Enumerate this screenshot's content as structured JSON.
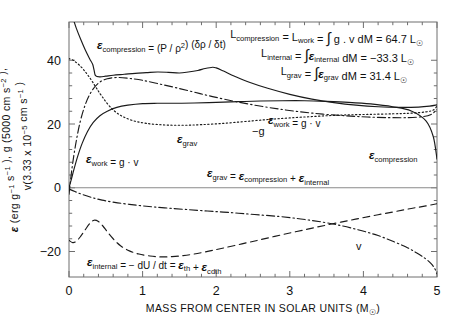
{
  "figure": {
    "background": "#ffffff",
    "ink_color": "#1a1a1a",
    "axis_color": "#6e6e6e"
  },
  "axes": {
    "x": {
      "label_prefix": "MASS FROM CENTER IN SOLAR UNITS (M",
      "label_suffix": ")",
      "label_sub": "☉",
      "ticks": [
        "0",
        "1",
        "2",
        "3",
        "4",
        "5"
      ],
      "tick_values": [
        0,
        1,
        2,
        3,
        4,
        5
      ],
      "range": [
        0,
        5
      ],
      "minor_per_interval": 4
    },
    "y": {
      "label_parts": {
        "eps": "ε",
        "p1": " (erg g",
        "e1": "−1",
        "p2": " s",
        "e2": "−1",
        "p3": " ), g (5000 cm s",
        "e3": "−2",
        "p4": " ),",
        "line2_a": "v(3.33 x 10",
        "line2_e": "−5",
        "line2_b": " cm s",
        "line2_e2": "−1",
        "line2_c": " )"
      },
      "ticks": [
        "40",
        "20",
        "0",
        "−20"
      ],
      "tick_values": [
        40,
        20,
        0,
        -20
      ],
      "range": [
        -28,
        52
      ],
      "minor_per_interval": 4
    }
  },
  "annotations": {
    "luminosity_block": [
      {
        "id": "L-compression",
        "segments": [
          {
            "t": "L",
            "style": "plain"
          },
          {
            "t": "compression",
            "style": "sub"
          },
          {
            "t": " = L",
            "style": "plain"
          },
          {
            "t": "work",
            "style": "sub"
          },
          {
            "t": " = ",
            "style": "plain"
          },
          {
            "t": "∫",
            "style": "integral"
          },
          {
            "t": " g . v dM = 64.7 L",
            "style": "plain"
          },
          {
            "t": "☉",
            "style": "sub"
          }
        ]
      },
      {
        "id": "L-internal",
        "segments": [
          {
            "t": "L",
            "style": "plain"
          },
          {
            "t": "internal",
            "style": "sub"
          },
          {
            "t": " = ",
            "style": "plain"
          },
          {
            "t": "∫",
            "style": "integral"
          },
          {
            "t": "ε",
            "style": "eps"
          },
          {
            "t": "internal",
            "style": "sub"
          },
          {
            "t": " dM = −33.3 L",
            "style": "plain"
          },
          {
            "t": "☉",
            "style": "sub"
          }
        ]
      },
      {
        "id": "L-grav",
        "segments": [
          {
            "t": "L",
            "style": "plain"
          },
          {
            "t": "grav",
            "style": "sub"
          },
          {
            "t": " = ",
            "style": "plain"
          },
          {
            "t": "∫",
            "style": "integral"
          },
          {
            "t": "ε",
            "style": "eps"
          },
          {
            "t": "grav",
            "style": "sub"
          },
          {
            "t": " dM = 31.4 L",
            "style": "plain"
          },
          {
            "t": "☉",
            "style": "sub"
          }
        ]
      }
    ],
    "curve_labels": [
      {
        "id": "eps-compression-def",
        "x": 97,
        "y": 49,
        "segments": [
          {
            "t": "ε",
            "style": "eps"
          },
          {
            "t": "compression",
            "style": "sub"
          },
          {
            "t": " = (P / ρ",
            "style": "plain"
          },
          {
            "t": "2",
            "style": "sup"
          },
          {
            "t": ") (δρ / δt)",
            "style": "plain"
          }
        ]
      },
      {
        "id": "eps-work-def",
        "x": 86,
        "y": 163,
        "segments": [
          {
            "t": "ε",
            "style": "eps"
          },
          {
            "t": "work",
            "style": "sub"
          },
          {
            "t": " = g · v",
            "style": "plain"
          }
        ]
      },
      {
        "id": "eps-work-top",
        "x": 268,
        "y": 124,
        "segments": [
          {
            "t": "ε",
            "style": "eps"
          },
          {
            "t": "work",
            "style": "sub"
          },
          {
            "t": " = g · v",
            "style": "plain"
          }
        ]
      },
      {
        "id": "eps-grav-label",
        "x": 177,
        "y": 143,
        "segments": [
          {
            "t": "ε",
            "style": "eps"
          },
          {
            "t": "grav",
            "style": "sub"
          }
        ]
      },
      {
        "id": "minus-g-label",
        "x": 252,
        "y": 135,
        "segments": [
          {
            "t": "−g",
            "style": "plain"
          }
        ]
      },
      {
        "id": "eps-compression-right",
        "x": 369,
        "y": 159,
        "segments": [
          {
            "t": "ε",
            "style": "eps"
          },
          {
            "t": "compression",
            "style": "sub"
          }
        ]
      },
      {
        "id": "eps-grav-sum",
        "x": 207,
        "y": 177,
        "segments": [
          {
            "t": "ε",
            "style": "eps"
          },
          {
            "t": "grav",
            "style": "sub"
          },
          {
            "t": " = ",
            "style": "plain"
          },
          {
            "t": "ε",
            "style": "eps"
          },
          {
            "t": "compression",
            "style": "sub"
          },
          {
            "t": " + ",
            "style": "plain"
          },
          {
            "t": "ε",
            "style": "eps"
          },
          {
            "t": "internal",
            "style": "sub"
          }
        ]
      },
      {
        "id": "eps-internal-def",
        "x": 87,
        "y": 266,
        "segments": [
          {
            "t": "ε",
            "style": "eps"
          },
          {
            "t": "internal",
            "style": "sub"
          },
          {
            "t": " = − dU / dt = ",
            "style": "plain"
          },
          {
            "t": "ε",
            "style": "eps"
          },
          {
            "t": "th",
            "style": "sub"
          },
          {
            "t": " + ",
            "style": "plain"
          },
          {
            "t": "ε",
            "style": "eps"
          },
          {
            "t": "cdth",
            "style": "sub"
          }
        ]
      },
      {
        "id": "v-label",
        "x": 356,
        "y": 250,
        "segments": [
          {
            "t": "v",
            "style": "plain"
          }
        ]
      }
    ]
  },
  "chart_data": {
    "type": "line",
    "title": "",
    "xlabel": "MASS FROM CENTER IN SOLAR UNITS (M_sun)",
    "ylabel": "epsilon (erg g^-1 s^-1), g (5000 cm s^-2), v(3.33 x 10^-5 cm s^-1)",
    "xlim": [
      0,
      5
    ],
    "ylim": [
      -28,
      52
    ],
    "grid": false,
    "legend": "inline curve labels",
    "series": [
      {
        "name": "epsilon_compression",
        "linestyle": "solid",
        "label_on_plot": "ε_compression",
        "x": [
          0.0,
          0.05,
          0.1,
          0.16,
          0.22,
          0.28,
          0.32,
          0.34,
          0.36,
          0.42,
          0.5,
          0.6,
          0.75,
          0.9,
          1.05,
          1.2,
          1.35,
          1.5,
          1.62,
          1.75,
          1.85,
          1.95,
          2.0,
          2.1,
          2.25,
          2.45,
          2.7,
          3.0,
          3.3,
          3.6,
          3.9,
          4.2,
          4.5,
          4.75,
          4.9,
          5.0
        ],
        "y": [
          57.0,
          53.5,
          50.0,
          46.5,
          43.3,
          40.5,
          38.8,
          37.0,
          35.2,
          34.8,
          35.0,
          35.3,
          35.6,
          35.9,
          36.1,
          36.3,
          36.2,
          36.0,
          36.3,
          36.8,
          37.4,
          37.8,
          37.6,
          36.6,
          35.0,
          33.1,
          31.2,
          29.3,
          27.8,
          26.7,
          25.9,
          25.4,
          25.2,
          25.3,
          25.6,
          26.0
        ]
      },
      {
        "name": "epsilon_work",
        "linestyle": "solid",
        "label_on_plot": "ε_work = g · v",
        "x": [
          0.0,
          0.03,
          0.07,
          0.12,
          0.18,
          0.25,
          0.33,
          0.42,
          0.52,
          0.65,
          0.8,
          1.0,
          1.2,
          1.45,
          1.7,
          2.0,
          2.3,
          2.6,
          2.9,
          3.2,
          3.5,
          3.8,
          4.1,
          4.4,
          4.65,
          4.85,
          4.95,
          5.0
        ],
        "y": [
          0.0,
          2.5,
          6.0,
          10.0,
          14.0,
          17.6,
          20.5,
          22.6,
          24.0,
          25.2,
          25.9,
          26.4,
          26.5,
          26.5,
          26.6,
          26.8,
          27.0,
          27.2,
          27.3,
          27.3,
          27.1,
          26.8,
          26.3,
          25.4,
          24.1,
          21.0,
          16.0,
          9.0
        ]
      },
      {
        "name": "epsilon_grav",
        "linestyle": "dotted",
        "label_on_plot": "ε_grav = ε_compression + ε_internal",
        "x": [
          0.0,
          0.04,
          0.08,
          0.14,
          0.2,
          0.26,
          0.32,
          0.38,
          0.45,
          0.55,
          0.68,
          0.85,
          1.05,
          1.3,
          1.55,
          1.8,
          2.1,
          2.4,
          2.7,
          3.0,
          3.35,
          3.7,
          4.05,
          4.4,
          4.65,
          4.85,
          4.95,
          5.0
        ],
        "y": [
          40.5,
          40.2,
          39.6,
          38.5,
          37.0,
          35.2,
          33.2,
          31.0,
          28.6,
          25.6,
          23.0,
          21.2,
          20.2,
          19.7,
          19.6,
          19.8,
          20.2,
          20.8,
          21.4,
          21.9,
          22.4,
          22.8,
          23.0,
          23.2,
          23.4,
          23.8,
          24.4,
          25.6
        ]
      },
      {
        "name": "minus_g",
        "linestyle": "dashdot",
        "label_on_plot": "−g",
        "x": [
          0.0,
          0.04,
          0.09,
          0.15,
          0.22,
          0.3,
          0.4,
          0.52,
          0.66,
          0.82,
          1.0,
          1.22,
          1.45,
          1.7,
          1.95,
          2.25,
          2.55,
          2.85,
          3.15,
          3.45,
          3.75,
          4.05,
          4.35,
          4.6,
          4.8,
          4.92,
          5.0
        ],
        "y": [
          -2.0,
          6.0,
          13.5,
          20.5,
          26.0,
          30.0,
          32.8,
          34.2,
          34.6,
          34.3,
          33.7,
          32.6,
          31.4,
          30.0,
          28.6,
          27.1,
          25.8,
          24.7,
          23.8,
          23.1,
          22.6,
          22.2,
          22.0,
          22.0,
          22.3,
          23.0,
          24.5
        ]
      },
      {
        "name": "epsilon_internal",
        "linestyle": "dashed",
        "label_on_plot": "ε_internal = − dU/dt",
        "x": [
          0.0,
          0.05,
          0.1,
          0.16,
          0.22,
          0.28,
          0.34,
          0.4,
          0.46,
          0.52,
          0.6,
          0.7,
          0.82,
          0.95,
          1.1,
          1.25,
          1.4,
          1.55,
          1.7,
          1.9,
          2.1,
          2.35,
          2.6,
          2.9,
          3.2,
          3.5,
          3.8,
          4.1,
          4.4,
          4.65,
          4.85,
          5.0
        ],
        "y": [
          -16.5,
          -17.2,
          -16.8,
          -15.2,
          -13.2,
          -11.3,
          -10.2,
          -10.6,
          -12.0,
          -13.8,
          -16.0,
          -18.2,
          -19.8,
          -20.8,
          -21.4,
          -21.7,
          -21.6,
          -21.3,
          -20.8,
          -19.9,
          -18.9,
          -17.6,
          -16.3,
          -14.7,
          -13.2,
          -11.7,
          -10.3,
          -8.9,
          -7.6,
          -6.5,
          -5.7,
          -5.0
        ]
      },
      {
        "name": "velocity_v",
        "linestyle": "dashdot",
        "label_on_plot": "v",
        "x": [
          0.0,
          0.08,
          0.18,
          0.3,
          0.45,
          0.62,
          0.82,
          1.05,
          1.3,
          1.58,
          1.88,
          2.2,
          2.52,
          2.85,
          3.15,
          3.45,
          3.72,
          3.98,
          4.2,
          4.4,
          4.58,
          4.72,
          4.84,
          4.92,
          4.97,
          5.0
        ],
        "y": [
          -0.4,
          -1.2,
          -2.1,
          -3.0,
          -3.9,
          -4.6,
          -5.2,
          -5.8,
          -6.3,
          -6.8,
          -7.3,
          -7.8,
          -8.4,
          -9.0,
          -9.8,
          -10.8,
          -12.0,
          -13.5,
          -15.0,
          -16.8,
          -18.6,
          -20.4,
          -22.2,
          -23.8,
          -25.4,
          -27.0
        ]
      }
    ],
    "secondary_epsilon_work_upper": {
      "name": "epsilon_work_upper_branch",
      "note": "upper solid arc peaking near 28 used as the g.v envelope",
      "x": [],
      "y": []
    }
  }
}
